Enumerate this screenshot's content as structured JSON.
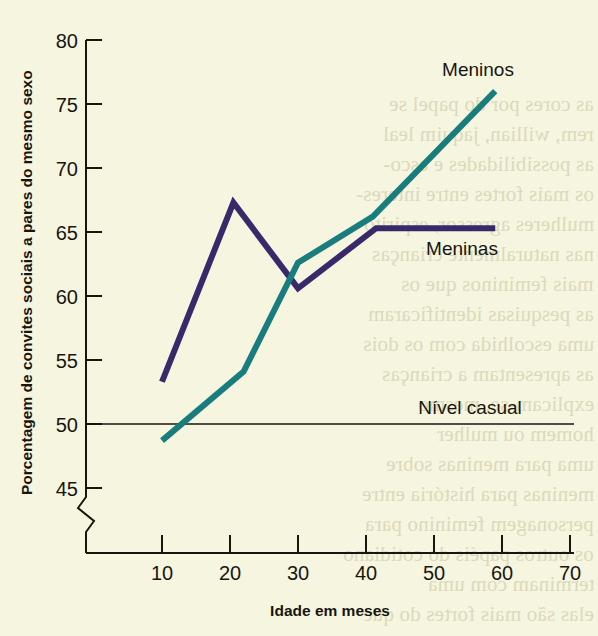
{
  "chart_data": {
    "type": "line",
    "title": "",
    "xlabel": "Idade em meses",
    "ylabel": "Porcentagem de convites sociais a pares do mesmo sexo",
    "xlim": [
      0,
      70
    ],
    "ylim": [
      42,
      80
    ],
    "y_axis_break": true,
    "grid": false,
    "legend_position": "inline-end-of-line",
    "xticks": [
      10,
      20,
      30,
      40,
      50,
      60,
      70
    ],
    "xtick_labels": [
      "10",
      "20",
      "30",
      "40",
      "50",
      "60",
      "70"
    ],
    "yticks": [
      45,
      50,
      55,
      60,
      65,
      70,
      75,
      80
    ],
    "ytick_labels": [
      "45",
      "50",
      "55",
      "60",
      "65",
      "70",
      "75",
      "80"
    ],
    "annotations": [
      {
        "name": "chance-level",
        "label": "Nível casual",
        "y": 50,
        "type": "horizontal-reference-line"
      }
    ],
    "series": [
      {
        "name": "Meninos",
        "color": "#197d7d",
        "x": [
          10,
          22,
          30,
          41,
          59
        ],
        "values": [
          48.7,
          54.1,
          62.6,
          66.2,
          76.0
        ]
      },
      {
        "name": "Meninas",
        "color": "#39296b",
        "x": [
          10,
          20.5,
          30,
          41.5,
          59
        ],
        "values": [
          53.3,
          67.3,
          60.6,
          65.3,
          65.3
        ]
      }
    ]
  },
  "labels": {
    "y_axis_title": "Porcentagem de convites sociais a pares do mesmo sexo",
    "x_axis_title": "Idade em meses",
    "series_boys": "Meninos",
    "series_girls": "Meninas",
    "chance_level": "Nível casual"
  },
  "colors": {
    "page_background": "#f6f5e0",
    "boys_line": "#197d7d",
    "girls_line": "#39296b",
    "axis": "#16160f",
    "text": "#16160f",
    "bleed_text": "#d8d5b4"
  },
  "bleed_text": {
    "lines": [
      "as cores por do papel se",
      "rem, willian, jaquim leal",
      "as possibilidades e esco-",
      "os mais fortes entre interes-",
      "mulheres agressor, espirito",
      "nas naturalmente crianças",
      "mais femininos que os",
      "as pesquisas identificaram",
      "uma escolhida com os dois",
      "as apresentam a crianças",
      "explicam-se, mesmo",
      "homem ou mulher",
      "uma para meninas sobre",
      "meninas para história entre",
      "personagem feminino para",
      "os outros papéis do cotidiano",
      "terminam com uma",
      "elas são mais fortes do que"
    ]
  }
}
